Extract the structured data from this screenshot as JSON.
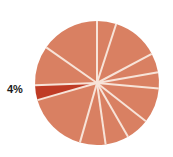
{
  "chart_data": {
    "type": "pie",
    "title": "",
    "subtitle": "",
    "xlabel": "",
    "ylabel": "",
    "legend": "none",
    "grid": false,
    "center": {
      "x": 97,
      "y": 83
    },
    "radius": 62,
    "start_angle_deg": 0,
    "direction": "clockwise",
    "separator_color": "#f7e3d8",
    "separator_width_px": 2,
    "default_color": "#d98062",
    "highlight_color": "#bf3b25",
    "labels_shown": [
      "4%"
    ],
    "categories": [
      "Slice 1",
      "Slice 2",
      "Slice 3",
      "Slice 4",
      "Slice 5",
      "Slice 6",
      "Slice 7",
      "Slice 8",
      "Slice 9",
      "Slice 10",
      "Slice 11",
      "Slice 12"
    ],
    "values": [
      5,
      12,
      5,
      4,
      9,
      6,
      6,
      7,
      16,
      4,
      10,
      16
    ],
    "slices": [
      {
        "name": "Slice 1",
        "start_deg": 0,
        "end_deg": 18,
        "value": 5,
        "color": "#d98062",
        "label": "",
        "highlighted": false
      },
      {
        "name": "Slice 2",
        "start_deg": 18,
        "end_deg": 62,
        "value": 12,
        "color": "#d98062",
        "label": "",
        "highlighted": false
      },
      {
        "name": "Slice 3",
        "start_deg": 62,
        "end_deg": 80,
        "value": 5,
        "color": "#d98062",
        "label": "",
        "highlighted": false
      },
      {
        "name": "Slice 4",
        "start_deg": 80,
        "end_deg": 95,
        "value": 4,
        "color": "#d98062",
        "label": "",
        "highlighted": false
      },
      {
        "name": "Slice 5",
        "start_deg": 95,
        "end_deg": 128,
        "value": 9,
        "color": "#d98062",
        "label": "",
        "highlighted": false
      },
      {
        "name": "Slice 6",
        "start_deg": 128,
        "end_deg": 150,
        "value": 6,
        "color": "#d98062",
        "label": "",
        "highlighted": false
      },
      {
        "name": "Slice 7",
        "start_deg": 150,
        "end_deg": 172,
        "value": 6,
        "color": "#d98062",
        "label": "",
        "highlighted": false
      },
      {
        "name": "Slice 8",
        "start_deg": 172,
        "end_deg": 196,
        "value": 7,
        "color": "#d98062",
        "label": "",
        "highlighted": false
      },
      {
        "name": "Slice 9",
        "start_deg": 196,
        "end_deg": 254,
        "value": 16,
        "color": "#d98062",
        "label": "",
        "highlighted": false
      },
      {
        "name": "Slice 10",
        "start_deg": 254,
        "end_deg": 268,
        "value": 4,
        "color": "#bf3b25",
        "label": "4%",
        "highlighted": true
      },
      {
        "name": "Slice 11",
        "start_deg": 268,
        "end_deg": 305,
        "value": 10,
        "color": "#d98062",
        "label": "",
        "highlighted": false
      },
      {
        "name": "Slice 12",
        "start_deg": 305,
        "end_deg": 360,
        "value": 16,
        "color": "#d98062",
        "label": "",
        "highlighted": false
      }
    ]
  },
  "labels": {
    "highlighted_slice_percent": "4%"
  }
}
